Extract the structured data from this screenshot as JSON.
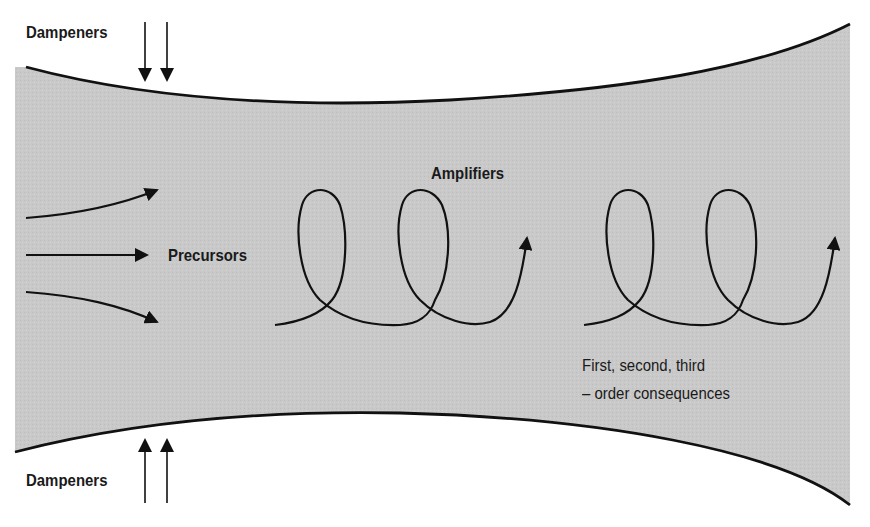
{
  "diagram": {
    "colors": {
      "fill": "#c9c9c9",
      "stroke": "#111111",
      "background": "#ffffff"
    },
    "labels": {
      "dampeners_top": "Dampeners",
      "dampeners_bottom": "Dampeners",
      "precursors": "Precursors",
      "amplifiers": "Amplifiers",
      "consequences_line1": "First, second, third",
      "consequences_line2": "– order consequences"
    },
    "elements": {
      "channel": "funnel-shaped gray channel bounded by curved lines",
      "dampener_arrows_top": 2,
      "dampener_arrows_bottom": 2,
      "precursor_arrows": 3,
      "amplifier_spirals": 2
    }
  }
}
